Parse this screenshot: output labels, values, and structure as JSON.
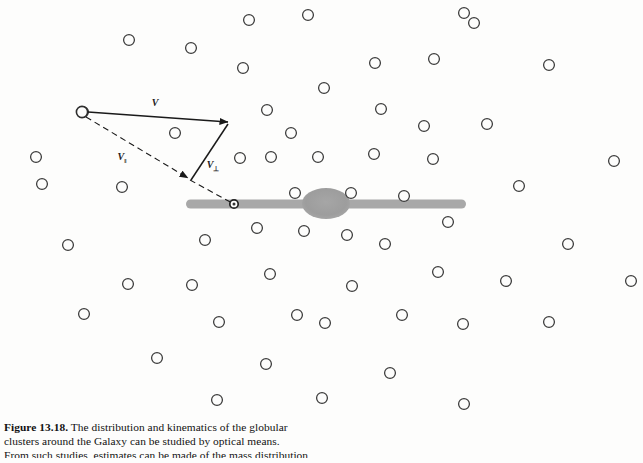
{
  "figure": {
    "number": "Figure 13.18.",
    "caption_line_1": "The distribution and kinematics of the globular",
    "caption_line_2": "clusters around the Galaxy can be studied by optical means.",
    "caption_line_3": "From such studies, estimates can be made of the mass distribution",
    "caption_full": "Figure 13.18. The distribution and kinematics of the globular clusters around the Galaxy can be studied by optical means. From such studies, estimates can be made of the mass distribution"
  },
  "diagram": {
    "vector_total_label": "V",
    "vector_parallel_label": "V",
    "vector_parallel_subscript": "‖",
    "vector_perpendicular_label": "V",
    "vector_perpendicular_subscript": "⊥",
    "galaxy_disk_name": "galactic-disk",
    "galaxy_bulge_name": "galactic-bulge",
    "sun_marker_name": "sun-position-marker",
    "origin_cluster_name": "origin-globular-cluster"
  },
  "colors": {
    "background": "#fdfdfc",
    "disk_gray": "#a8a8a8",
    "bulge_gray": "#9d9d9d",
    "cluster_stroke": "#3a3a3a",
    "vector_stroke": "#1a1a1a",
    "caption_text": "#111111"
  },
  "geometry": {
    "disk": {
      "x1": 186,
      "x2": 466,
      "y": 204,
      "thickness": 9
    },
    "bulge": {
      "cx": 326,
      "cy": 203,
      "rx": 24,
      "ry": 15
    },
    "sun": {
      "cx": 234,
      "cy": 204,
      "r": 4
    },
    "origin": {
      "cx": 82,
      "cy": 112,
      "r": 5.5
    },
    "v_tip": {
      "x": 228,
      "y": 122
    },
    "vpar_tip": {
      "x": 188,
      "y": 178
    },
    "cluster_radius": 5.4
  },
  "clusters": [
    {
      "cx": 464,
      "cy": 13
    },
    {
      "cx": 249,
      "cy": 20
    },
    {
      "cx": 308,
      "cy": 15
    },
    {
      "cx": 474,
      "cy": 23
    },
    {
      "cx": 129,
      "cy": 40
    },
    {
      "cx": 191,
      "cy": 48
    },
    {
      "cx": 243,
      "cy": 68
    },
    {
      "cx": 375,
      "cy": 63
    },
    {
      "cx": 434,
      "cy": 59
    },
    {
      "cx": 549,
      "cy": 65
    },
    {
      "cx": 324,
      "cy": 88
    },
    {
      "cx": 83,
      "cy": 112
    },
    {
      "cx": 267,
      "cy": 110
    },
    {
      "cx": 381,
      "cy": 109
    },
    {
      "cx": 175,
      "cy": 133
    },
    {
      "cx": 291,
      "cy": 133
    },
    {
      "cx": 424,
      "cy": 126
    },
    {
      "cx": 487,
      "cy": 124
    },
    {
      "cx": 36,
      "cy": 157
    },
    {
      "cx": 240,
      "cy": 158
    },
    {
      "cx": 271,
      "cy": 157
    },
    {
      "cx": 318,
      "cy": 157
    },
    {
      "cx": 374,
      "cy": 154
    },
    {
      "cx": 433,
      "cy": 159
    },
    {
      "cx": 614,
      "cy": 161
    },
    {
      "cx": 42,
      "cy": 184
    },
    {
      "cx": 295,
      "cy": 193
    },
    {
      "cx": 351,
      "cy": 193
    },
    {
      "cx": 404,
      "cy": 196
    },
    {
      "cx": 519,
      "cy": 186
    },
    {
      "cx": 122,
      "cy": 187
    },
    {
      "cx": 205,
      "cy": 240
    },
    {
      "cx": 257,
      "cy": 228
    },
    {
      "cx": 304,
      "cy": 231
    },
    {
      "cx": 347,
      "cy": 235
    },
    {
      "cx": 385,
      "cy": 244
    },
    {
      "cx": 448,
      "cy": 222
    },
    {
      "cx": 68,
      "cy": 245
    },
    {
      "cx": 568,
      "cy": 244
    },
    {
      "cx": 128,
      "cy": 284
    },
    {
      "cx": 192,
      "cy": 285
    },
    {
      "cx": 270,
      "cy": 274
    },
    {
      "cx": 352,
      "cy": 286
    },
    {
      "cx": 438,
      "cy": 272
    },
    {
      "cx": 506,
      "cy": 281
    },
    {
      "cx": 631,
      "cy": 281
    },
    {
      "cx": 297,
      "cy": 315
    },
    {
      "cx": 402,
      "cy": 315
    },
    {
      "cx": 84,
      "cy": 314
    },
    {
      "cx": 219,
      "cy": 322
    },
    {
      "cx": 325,
      "cy": 323
    },
    {
      "cx": 463,
      "cy": 324
    },
    {
      "cx": 549,
      "cy": 322
    },
    {
      "cx": 157,
      "cy": 358
    },
    {
      "cx": 266,
      "cy": 364
    },
    {
      "cx": 390,
      "cy": 373
    },
    {
      "cx": 217,
      "cy": 400
    },
    {
      "cx": 322,
      "cy": 398
    },
    {
      "cx": 464,
      "cy": 404
    }
  ]
}
